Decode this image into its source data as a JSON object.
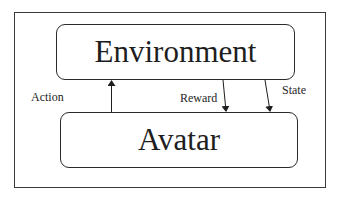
{
  "diagram": {
    "nodes": [
      {
        "id": "environment",
        "label": "Environment"
      },
      {
        "id": "avatar",
        "label": "Avatar"
      }
    ],
    "edges": [
      {
        "from": "avatar",
        "to": "environment",
        "label": "Action"
      },
      {
        "from": "environment",
        "to": "avatar",
        "label": "Reward"
      },
      {
        "from": "environment",
        "to": "avatar",
        "label": "State"
      }
    ],
    "colors": {
      "stroke": "#2a2a2a",
      "background": "#ffffff"
    }
  }
}
